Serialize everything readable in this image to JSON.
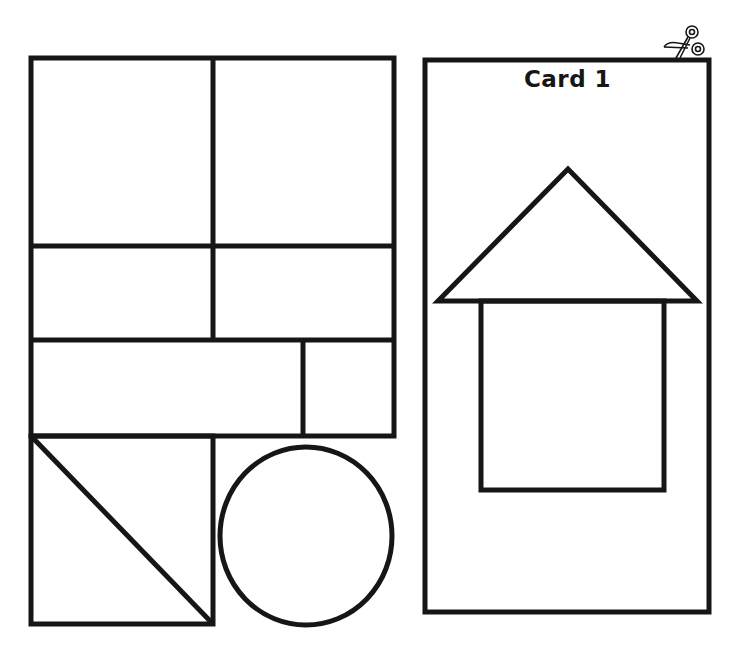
{
  "sheet": {
    "stroke_color": "#161616",
    "background": "#ffffff"
  },
  "left_panel": {
    "label": "shape-cutouts",
    "pieces": [
      {
        "id": "square-top-left",
        "shape": "rectangle"
      },
      {
        "id": "square-top-right",
        "shape": "rectangle"
      },
      {
        "id": "rect-middle-left",
        "shape": "rectangle"
      },
      {
        "id": "rect-middle-right",
        "shape": "rectangle"
      },
      {
        "id": "long-rect",
        "shape": "rectangle"
      },
      {
        "id": "small-rect",
        "shape": "rectangle"
      },
      {
        "id": "triangle-lower",
        "shape": "triangle"
      },
      {
        "id": "triangle-upper",
        "shape": "triangle"
      },
      {
        "id": "circle",
        "shape": "circle"
      }
    ]
  },
  "card": {
    "title": "Card 1",
    "picture": "house",
    "parts": [
      {
        "id": "roof",
        "shape": "triangle"
      },
      {
        "id": "house-body",
        "shape": "rectangle"
      }
    ]
  },
  "icons": {
    "scissors": "scissors-icon"
  }
}
